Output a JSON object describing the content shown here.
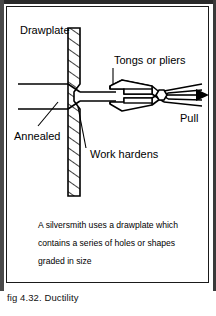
{
  "figure": {
    "title": "fig 4.32.  Ductility",
    "diagram_type": "wire-drawing-ductility-diagram",
    "labels": {
      "drawplate": "Drawplate",
      "annealed": "Annealed",
      "work_hardens": "Work hardens",
      "tongs_or_pliers": "Tongs or pliers",
      "pull": "Pull"
    },
    "caption": {
      "line1": "A silversmith uses a drawplate which",
      "line2": "contains a series of holes or shapes",
      "line3": "graded in size"
    },
    "colors": {
      "ink": "#000000",
      "paper": "#ffffff",
      "page_edge": "#2a2a2a"
    }
  }
}
